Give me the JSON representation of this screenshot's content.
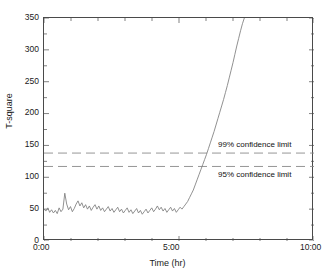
{
  "chart_data": {
    "type": "line",
    "title": "",
    "xlabel": "Time (hr)",
    "ylabel": "T-square",
    "xlim": [
      0,
      10
    ],
    "ylim": [
      0,
      350
    ],
    "grid": false,
    "legend": "none",
    "x_tick_labels": [
      "0:00",
      "5:00",
      "10:00"
    ],
    "x_tick_values": [
      0,
      5,
      10
    ],
    "y_tick_labels": [
      "0",
      "50",
      "100",
      "150",
      "200",
      "250",
      "300",
      "350"
    ],
    "y_tick_values": [
      0,
      50,
      100,
      150,
      200,
      250,
      300,
      350
    ],
    "series": [
      {
        "name": "T-square",
        "style": "solid",
        "color": "#7d7d7d",
        "x": [
          0.0,
          0.07,
          0.14,
          0.21,
          0.28,
          0.35,
          0.42,
          0.49,
          0.56,
          0.63,
          0.7,
          0.77,
          0.84,
          0.91,
          0.98,
          1.05,
          1.12,
          1.19,
          1.26,
          1.33,
          1.4,
          1.47,
          1.54,
          1.61,
          1.68,
          1.75,
          1.82,
          1.89,
          1.96,
          2.03,
          2.1,
          2.17,
          2.24,
          2.31,
          2.38,
          2.45,
          2.52,
          2.59,
          2.66,
          2.73,
          2.8,
          2.87,
          2.94,
          3.01,
          3.08,
          3.15,
          3.22,
          3.29,
          3.36,
          3.43,
          3.5,
          3.57,
          3.64,
          3.71,
          3.78,
          3.85,
          3.92,
          3.99,
          4.06,
          4.13,
          4.2,
          4.27,
          4.34,
          4.41,
          4.48,
          4.55,
          4.62,
          4.69,
          4.76,
          4.83,
          4.9,
          4.97,
          5.04,
          5.11,
          5.18,
          5.25,
          5.32,
          5.39,
          5.46,
          5.53,
          5.6,
          5.67,
          5.74,
          5.81,
          5.88,
          5.95,
          6.02,
          6.09,
          6.16,
          6.23,
          6.3,
          6.37,
          6.44,
          6.51,
          6.58,
          6.65,
          6.72,
          6.79,
          6.86,
          6.93,
          7.0,
          7.07,
          7.14,
          7.21,
          7.28,
          7.35,
          7.42
        ],
        "y": [
          50,
          47,
          52,
          45,
          49,
          44,
          48,
          43,
          52,
          46,
          50,
          75,
          58,
          49,
          54,
          46,
          51,
          58,
          63,
          55,
          60,
          52,
          57,
          50,
          55,
          48,
          53,
          57,
          50,
          55,
          48,
          52,
          46,
          50,
          54,
          47,
          51,
          45,
          49,
          53,
          46,
          50,
          44,
          48,
          52,
          45,
          49,
          43,
          47,
          51,
          44,
          48,
          42,
          46,
          50,
          44,
          48,
          52,
          46,
          50,
          55,
          49,
          53,
          47,
          51,
          45,
          49,
          53,
          47,
          51,
          45,
          49,
          53,
          50,
          54,
          58,
          62,
          68,
          74,
          80,
          88,
          96,
          104,
          112,
          120,
          128,
          136,
          145,
          154,
          163,
          172,
          182,
          192,
          202,
          212,
          222,
          233,
          244,
          256,
          268,
          280,
          293,
          306,
          318,
          330,
          341,
          350
        ]
      }
    ],
    "reference_lines": [
      {
        "name": "99% confidence limit",
        "label": "99% confidence limit",
        "value": 138,
        "style": "dashed",
        "color": "#8a8a8a",
        "orientation": "horizontal"
      },
      {
        "name": "95% confidence limit",
        "label": "95% confidence limit",
        "value": 117,
        "style": "dashed",
        "color": "#8a8a8a",
        "orientation": "horizontal"
      }
    ]
  }
}
